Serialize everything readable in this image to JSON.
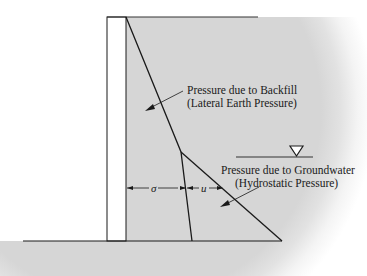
{
  "figure": {
    "labels": {
      "backfill_line1": "Pressure due to Backfill",
      "backfill_line2": "(Lateral Earth Pressure)",
      "groundwater_line1": "Pressure due to Groundwater",
      "groundwater_line2": "(Hydrostatic Pressure)",
      "sigma": "σ",
      "u": "u"
    },
    "symbols": {
      "water_table": "water-table-triangle"
    },
    "colors": {
      "soil": "#d6d6d6",
      "wall": "#ffffff",
      "line": "#1a1a1a"
    }
  }
}
